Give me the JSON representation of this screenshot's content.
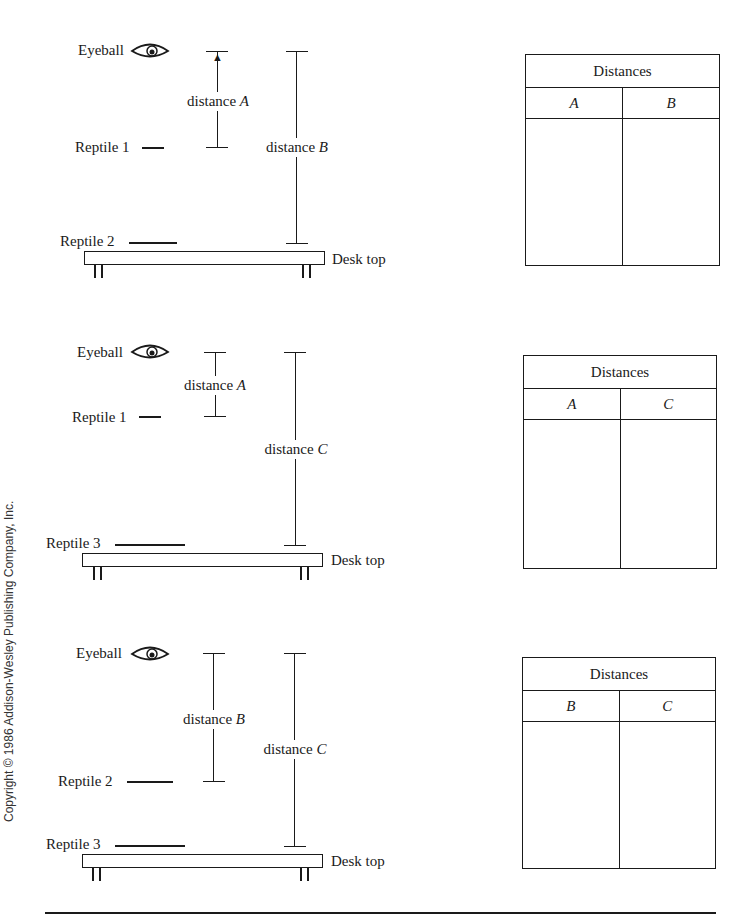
{
  "panels": [
    {
      "eyeball_label": "Eyeball",
      "upper_reptile_label": "Reptile 1",
      "lower_reptile_label": "Reptile 2",
      "short_distance_label": "distance",
      "short_distance_var": "A",
      "long_distance_label": "distance",
      "long_distance_var": "B",
      "desk_label": "Desk top",
      "table": {
        "title": "Distances",
        "columns": [
          "A",
          "B"
        ]
      }
    },
    {
      "eyeball_label": "Eyeball",
      "upper_reptile_label": "Reptile 1",
      "lower_reptile_label": "Reptile 3",
      "short_distance_label": "distance",
      "short_distance_var": "A",
      "long_distance_label": "distance",
      "long_distance_var": "C",
      "desk_label": "Desk top",
      "table": {
        "title": "Distances",
        "columns": [
          "A",
          "C"
        ]
      }
    },
    {
      "eyeball_label": "Eyeball",
      "upper_reptile_label": "Reptile 2",
      "lower_reptile_label": "Reptile 3",
      "short_distance_label": "distance",
      "short_distance_var": "B",
      "long_distance_label": "distance",
      "long_distance_var": "C",
      "desk_label": "Desk top",
      "table": {
        "title": "Distances",
        "columns": [
          "B",
          "C"
        ]
      }
    }
  ],
  "copyright": "Copyright © 1986 Addison-Wesley Publishing Company, Inc."
}
